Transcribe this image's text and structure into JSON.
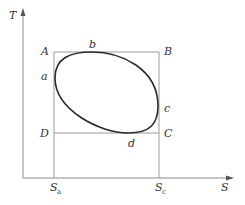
{
  "diagram": {
    "type": "T-S cycle diagram",
    "axes": {
      "y_label": "T",
      "x_label": "S",
      "x_ticks": [
        {
          "base": "S",
          "sub": "a"
        },
        {
          "base": "S",
          "sub": "c"
        }
      ]
    },
    "rectangle_corners": {
      "top_left": "A",
      "top_right": "B",
      "bottom_right": "C",
      "bottom_left": "D"
    },
    "cycle_points": {
      "left": "a",
      "top": "b",
      "right": "c",
      "bottom": "d"
    },
    "colors": {
      "axis": "#8a8a8a",
      "rectangle": "#9a9a9a",
      "cycle": "#2a2a2a",
      "text": "#333333"
    }
  }
}
